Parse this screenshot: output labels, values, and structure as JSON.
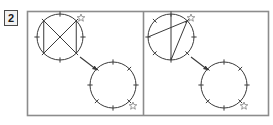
{
  "figure": {
    "panel_number": "2",
    "frame_color": "#8c8c8c",
    "stroke_color": "#3a3a3a",
    "background": "#ffffff",
    "star_color": "#8c8c8c",
    "width": 273,
    "height": 125
  },
  "panels": [
    {
      "id": "left-panel",
      "label": "left-panel",
      "source_circle": {
        "name": "source-circle",
        "cx": 60,
        "cy": 37,
        "r": 23,
        "tick_count": 8,
        "tick_angles_deg": [
          90,
          45,
          0,
          315,
          270,
          225,
          180,
          135
        ],
        "star_marker": {
          "x": 81,
          "y": 18,
          "size": 8,
          "label": "star-marker"
        },
        "chords": [
          {
            "from_deg": 135,
            "to_deg": 315,
            "label": "chord-nw-se"
          },
          {
            "from_deg": 45,
            "to_deg": 225,
            "label": "chord-ne-sw"
          },
          {
            "from_deg": 135,
            "to_deg": 225,
            "label": "chord-nw-sw"
          },
          {
            "from_deg": 45,
            "to_deg": 315,
            "label": "chord-ne-se"
          }
        ]
      },
      "target_circle": {
        "name": "target-circle",
        "cx": 113,
        "cy": 85,
        "r": 23,
        "tick_count": 8,
        "tick_angles_deg": [
          90,
          45,
          0,
          315,
          270,
          225,
          180,
          135
        ],
        "star_marker": {
          "x": 133,
          "y": 106,
          "size": 8,
          "label": "star-marker"
        },
        "chords": []
      },
      "arrow": {
        "x1": 80,
        "y1": 57,
        "x2": 97,
        "y2": 70,
        "label": "transform-arrow"
      }
    },
    {
      "id": "right-panel",
      "label": "right-panel",
      "source_circle": {
        "name": "source-circle",
        "cx": 171,
        "cy": 37,
        "r": 23,
        "tick_count": 8,
        "tick_angles_deg": [
          90,
          45,
          0,
          315,
          270,
          225,
          180,
          135
        ],
        "star_marker": {
          "x": 191,
          "y": 18,
          "size": 8,
          "label": "star-marker"
        },
        "chords": [
          {
            "from_deg": 90,
            "to_deg": 270,
            "label": "chord-n-s"
          },
          {
            "from_deg": 180,
            "to_deg": 45,
            "label": "chord-w-ne"
          },
          {
            "from_deg": 270,
            "to_deg": 45,
            "label": "chord-s-ne"
          }
        ]
      },
      "target_circle": {
        "name": "target-circle",
        "cx": 224,
        "cy": 85,
        "r": 23,
        "tick_count": 8,
        "tick_angles_deg": [
          90,
          45,
          0,
          315,
          270,
          225,
          180,
          135
        ],
        "star_marker": {
          "x": 244,
          "y": 106,
          "size": 8,
          "label": "star-marker"
        },
        "chords": []
      },
      "arrow": {
        "x1": 191,
        "y1": 57,
        "x2": 208,
        "y2": 70,
        "label": "transform-arrow"
      }
    }
  ],
  "frame": {
    "x": 27,
    "y": 11,
    "width": 241,
    "height": 104,
    "divider_x": 143
  }
}
